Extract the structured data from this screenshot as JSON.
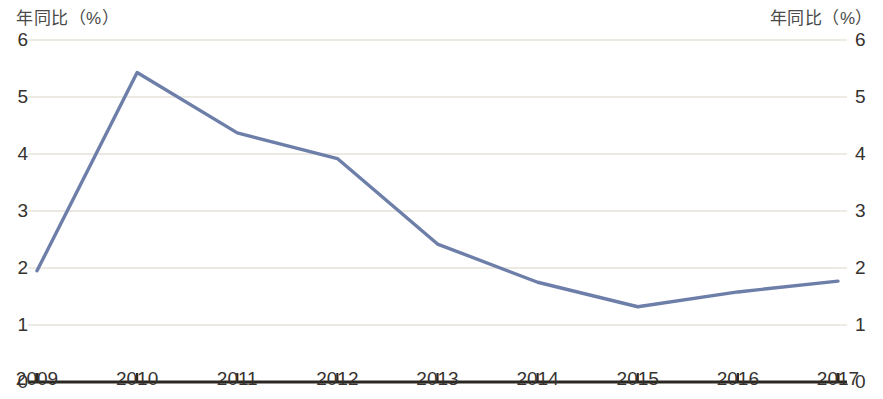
{
  "axis_captions": {
    "left": "年同比（%）",
    "right": "年同比（%）"
  },
  "chart_data": {
    "type": "line",
    "title": "",
    "subtitle": "",
    "xlabel": "",
    "ylabel": "年同比（%）",
    "y2label": "年同比（%）",
    "categories": [
      "2009",
      "2010",
      "2011",
      "2012",
      "2013",
      "2014",
      "2015",
      "2016",
      "2017"
    ],
    "series": [
      {
        "name": "年同比（%）",
        "color": "#6d7fa8",
        "values": [
          1.95,
          5.43,
          4.37,
          3.92,
          2.42,
          1.75,
          1.32,
          1.58,
          1.77
        ]
      }
    ],
    "ylim": [
      0,
      6
    ],
    "y2lim": [
      0,
      6
    ],
    "yticks": [
      "6",
      "5",
      "4",
      "3",
      "2",
      "1",
      "0"
    ],
    "y2ticks": [
      "6",
      "5",
      "4",
      "3",
      "2",
      "1",
      "0"
    ],
    "xticks": [
      "2009",
      "2010",
      "2011",
      "2012",
      "2013",
      "2014",
      "2015",
      "2016",
      "2017"
    ],
    "grid": true,
    "grid_color": "#e6e2d8",
    "axis_color": "#2b2823",
    "legend": "none",
    "legend_position": "none"
  }
}
